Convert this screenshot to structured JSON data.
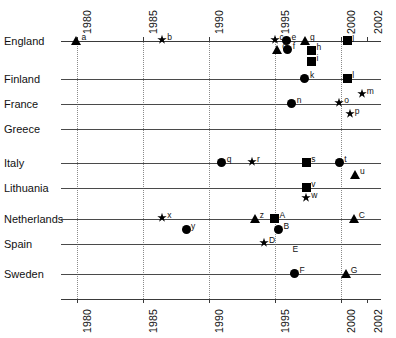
{
  "chart_data": {
    "type": "scatter",
    "title": "",
    "xlabel": "",
    "ylabel": "",
    "xlim": [
      1979.0,
      2002.7
    ],
    "grid": "vertical dotted gridlines at 5-year ticks plus horizontal category baselines",
    "legend": "none",
    "xticks": [
      "1980",
      "1985",
      "1990",
      "1995",
      "2000",
      "2002"
    ],
    "xtick_values": [
      1980,
      1985,
      1990,
      1995,
      2000,
      2002
    ],
    "categories": [
      "England",
      "Finland",
      "France",
      "Greece",
      "Italy",
      "Lithuania",
      "Netherlands",
      "Spain",
      "Sweden"
    ],
    "marker_shapes": [
      "circle",
      "square",
      "triangle",
      "star"
    ],
    "points": [
      {
        "label": "a",
        "category": "England",
        "x": 1980.0,
        "shape": "triangle",
        "offset_y": 0
      },
      {
        "label": "b",
        "category": "England",
        "x": 1986.5,
        "shape": "star",
        "offset_y": 0
      },
      {
        "label": "c",
        "category": "England",
        "x": 1995.0,
        "shape": "star",
        "offset_y": 0
      },
      {
        "label": "e",
        "category": "England",
        "x": 1995.9,
        "shape": "circle",
        "offset_y": 0
      },
      {
        "label": "d",
        "category": "England",
        "x": 1995.2,
        "shape": "triangle",
        "offset_y": 9
      },
      {
        "label": "f",
        "category": "England",
        "x": 1996.0,
        "shape": "circle",
        "offset_y": 9
      },
      {
        "label": "g",
        "category": "England",
        "x": 1997.3,
        "shape": "triangle",
        "offset_y": 0
      },
      {
        "label": "h",
        "category": "England",
        "x": 1997.8,
        "shape": "square",
        "offset_y": 10
      },
      {
        "label": "i",
        "category": "England",
        "x": 1997.8,
        "shape": "square",
        "offset_y": 21
      },
      {
        "label": "j",
        "category": "England",
        "x": 2000.5,
        "shape": "square",
        "offset_y": 0
      },
      {
        "label": "k",
        "category": "Finland",
        "x": 1997.3,
        "shape": "circle",
        "offset_y": 0
      },
      {
        "label": "l",
        "category": "Finland",
        "x": 2000.5,
        "shape": "square",
        "offset_y": 0
      },
      {
        "label": "m",
        "category": "France",
        "x": 2001.6,
        "shape": "star",
        "offset_y": -9
      },
      {
        "label": "n",
        "category": "France",
        "x": 1996.3,
        "shape": "circle",
        "offset_y": 0
      },
      {
        "label": "o",
        "category": "France",
        "x": 1999.9,
        "shape": "star",
        "offset_y": 0
      },
      {
        "label": "p",
        "category": "France",
        "x": 2000.7,
        "shape": "star",
        "offset_y": 11
      },
      {
        "label": "q",
        "category": "Italy",
        "x": 1991.0,
        "shape": "circle",
        "offset_y": 0
      },
      {
        "label": "r",
        "category": "Italy",
        "x": 1993.3,
        "shape": "star",
        "offset_y": 0
      },
      {
        "label": "s",
        "category": "Italy",
        "x": 1997.4,
        "shape": "square",
        "offset_y": 0
      },
      {
        "label": "t",
        "category": "Italy",
        "x": 1999.9,
        "shape": "circle",
        "offset_y": 0
      },
      {
        "label": "u",
        "category": "Italy",
        "x": 2001.1,
        "shape": "triangle",
        "offset_y": 12
      },
      {
        "label": "v",
        "category": "Lithuania",
        "x": 1997.4,
        "shape": "square",
        "offset_y": 0
      },
      {
        "label": "w",
        "category": "Lithuania",
        "x": 1997.4,
        "shape": "star",
        "offset_y": 11
      },
      {
        "label": "x",
        "category": "Netherlands",
        "x": 1986.5,
        "shape": "star",
        "offset_y": 0
      },
      {
        "label": "y",
        "category": "Netherlands",
        "x": 1988.3,
        "shape": "circle",
        "offset_y": 11
      },
      {
        "label": "z",
        "category": "Netherlands",
        "x": 1993.5,
        "shape": "triangle",
        "offset_y": 0
      },
      {
        "label": "A",
        "category": "Netherlands",
        "x": 1995.0,
        "shape": "square",
        "offset_y": 0
      },
      {
        "label": "B",
        "category": "Netherlands",
        "x": 1995.3,
        "shape": "circle",
        "offset_y": 11
      },
      {
        "label": "C",
        "category": "Netherlands",
        "x": 2001.0,
        "shape": "triangle",
        "offset_y": 0
      },
      {
        "label": "D",
        "category": "Spain",
        "x": 1994.2,
        "shape": "star",
        "offset_y": 0
      },
      {
        "label": "E",
        "category": "Spain",
        "x": 1996.5,
        "shape": "none",
        "offset_y": 0
      },
      {
        "label": "F",
        "category": "Sweden",
        "x": 1996.5,
        "shape": "circle",
        "offset_y": 0
      },
      {
        "label": "G",
        "category": "Sweden",
        "x": 2000.4,
        "shape": "triangle",
        "offset_y": 0
      }
    ]
  },
  "colors": {
    "marker": "#000000",
    "gridline": "#8a8a8a",
    "baseline": "#4a4a4a",
    "axis": "#3a3a3a",
    "text": "#111111",
    "background": "#ffffff"
  }
}
